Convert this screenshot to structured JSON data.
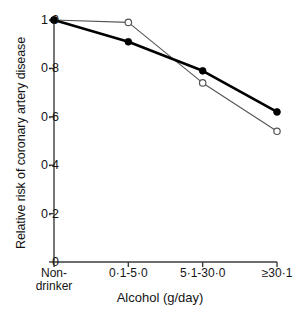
{
  "chart_data": {
    "type": "line",
    "title": "",
    "subtitle": "",
    "xlabel": "Alcohol (g/day)",
    "ylabel": "Relative risk of coronary artery disease",
    "categories": [
      "Non-drinker",
      "0·1-5·0",
      "5·1-30·0",
      "≥30·1"
    ],
    "category_lines": [
      [
        "Non-",
        "drinker"
      ],
      [
        "0·1-5·0"
      ],
      [
        "5·1-30·0"
      ],
      [
        "≥30·1"
      ]
    ],
    "series": [
      {
        "name": "filled-circle-series",
        "marker": "filled-circle",
        "line_style": "thick-solid",
        "color": "#000000",
        "values": [
          1.0,
          0.91,
          0.79,
          0.62
        ]
      },
      {
        "name": "open-circle-series",
        "marker": "open-circle",
        "line_style": "thin-solid",
        "color": "#555555",
        "values": [
          1.0,
          0.99,
          0.74,
          0.54
        ]
      }
    ],
    "ylim": [
      0,
      1.0
    ],
    "yticks": [
      0,
      0.2,
      0.4,
      0.6,
      0.8,
      1.0
    ],
    "ytick_labels": [
      "0",
      "0·2",
      "0·4",
      "0·6",
      "0·8",
      "1·0"
    ],
    "grid": false,
    "legend": "none",
    "axis_color": "#3c3c3c"
  },
  "yticks": [
    {
      "label": "1·0",
      "value": 1.0
    },
    {
      "label": "0·8",
      "value": 0.8
    },
    {
      "label": "0·6",
      "value": 0.6
    },
    {
      "label": "0·4",
      "value": 0.4
    },
    {
      "label": "0·2",
      "value": 0.2
    },
    {
      "label": "0",
      "value": 0
    }
  ],
  "xticks": [
    {
      "line1": "Non-",
      "line2": "drinker"
    },
    {
      "line1": "0·1-5·0",
      "line2": ""
    },
    {
      "line1": "5·1-30·0",
      "line2": ""
    },
    {
      "line1": "≥30·1",
      "line2": ""
    }
  ],
  "axis_titles": {
    "x": "Alcohol (g/day)",
    "y": "Relative risk of coronary artery disease"
  }
}
